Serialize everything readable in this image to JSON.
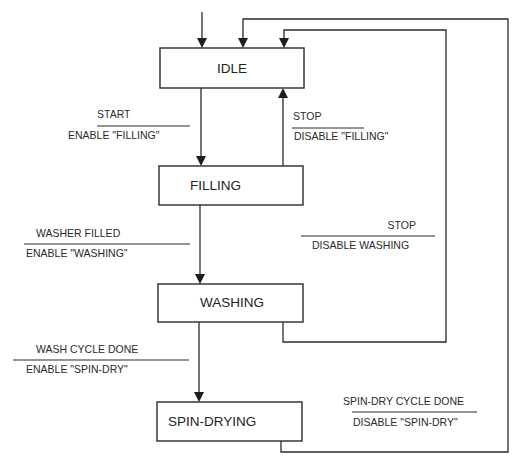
{
  "diagram": {
    "type": "state-machine",
    "states": [
      {
        "id": "idle",
        "label": "IDLE"
      },
      {
        "id": "filling",
        "label": "FILLING"
      },
      {
        "id": "washing",
        "label": "WASHING"
      },
      {
        "id": "spin_drying",
        "label": "SPIN-DRYING"
      }
    ],
    "transitions": [
      {
        "id": "start",
        "from": "idle",
        "to": "filling",
        "event": "START",
        "action": "ENABLE \"FILLING\""
      },
      {
        "id": "stop_filling",
        "from": "filling",
        "to": "idle",
        "event": "STOP",
        "action": "DISABLE \"FILLING\""
      },
      {
        "id": "washer_filled",
        "from": "filling",
        "to": "washing",
        "event": "WASHER FILLED",
        "action": "ENABLE \"WASHING\""
      },
      {
        "id": "stop_washing",
        "from": "washing",
        "to": "idle",
        "event": "STOP",
        "action": "DISABLE WASHING"
      },
      {
        "id": "wash_done",
        "from": "washing",
        "to": "spin_drying",
        "event": "WASH CYCLE DONE",
        "action": "ENABLE \"SPIN-DRY\""
      },
      {
        "id": "spin_done",
        "from": "spin_drying",
        "to": "idle",
        "event": "SPIN-DRY CYCLE DONE",
        "action": "DISABLE \"SPIN-DRY\""
      }
    ],
    "initial_state": "idle"
  }
}
